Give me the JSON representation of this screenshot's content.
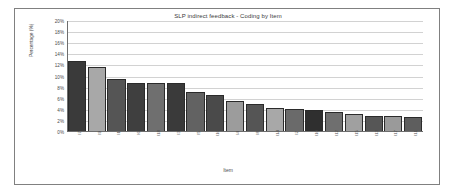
{
  "chart_data": {
    "type": "bar",
    "title": "SLP indirect feedback - Coding by Item",
    "xlabel": "Item",
    "ylabel": "Percentage (%)",
    "ylim": [
      0,
      20
    ],
    "ytick_labels": [
      "20%",
      "18%",
      "16%",
      "14%",
      "12%",
      "10%",
      "8%",
      "6%",
      "4%",
      "2%",
      "0%"
    ],
    "ytick_values": [
      20,
      18,
      16,
      14,
      12,
      10,
      8,
      6,
      4,
      2,
      0
    ],
    "grid": true,
    "legend": "none",
    "categories": [
      "I7",
      "I9",
      "I1",
      "I6",
      "I18",
      "I3",
      "I5",
      "I16",
      "I4",
      "I8",
      "I14",
      "I2",
      "I10",
      "I12",
      "I15",
      "I13",
      "I17",
      "I11"
    ],
    "values": [
      12.8,
      11.7,
      9.5,
      8.8,
      8.8,
      8.8,
      7.3,
      6.6,
      5.5,
      5.0,
      4.4,
      4.1,
      3.9,
      3.6,
      3.3,
      2.9,
      2.8,
      2.7
    ],
    "bar_colors": [
      "#3a3a3a",
      "#a8a8a8",
      "#555555",
      "#3f3f3f",
      "#6f6f6f",
      "#3a3a3a",
      "#626262",
      "#4a4a4a",
      "#9c9c9c",
      "#555555",
      "#a8a8a8",
      "#6a6a6a",
      "#2f2f2f",
      "#6f6f6f",
      "#a0a0a0",
      "#565656",
      "#9a9a9a",
      "#5e5e5e"
    ]
  },
  "frame": {
    "border_color": "#808080",
    "background": "#ffffff"
  }
}
